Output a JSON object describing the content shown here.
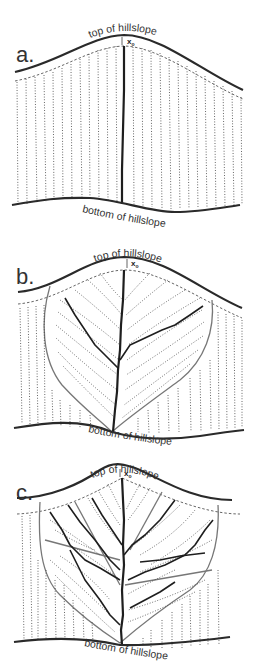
{
  "figure": {
    "panels": [
      {
        "id": "a",
        "label": "a.",
        "top_label": "top of hillslope",
        "bottom_label": "bottom of hillslope",
        "marker_label": "x",
        "marker_sub": "o"
      },
      {
        "id": "b",
        "label": "b.",
        "top_label": "top of hillslope",
        "bottom_label": "bottom of hillslope",
        "marker_label": "x",
        "marker_sub": "o"
      },
      {
        "id": "c",
        "label": "c.",
        "top_label": "top of hillslope",
        "bottom_label": "bottom of hillslope",
        "marker_label": "x",
        "marker_sub": "o"
      }
    ]
  }
}
